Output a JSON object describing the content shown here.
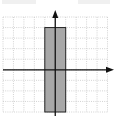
{
  "diagram": {
    "type": "coordinate-plane",
    "grid": {
      "x_min": -5,
      "x_max": 5,
      "y_min": -4,
      "y_max": 5,
      "step": 1,
      "line_style": "dotted",
      "line_color": "#c8c8c8"
    },
    "axes": {
      "color": "#111111",
      "x_axis_arrow": "right",
      "y_axis_arrow": "up"
    },
    "shape": {
      "kind": "rectangle",
      "x1": -1,
      "x2": 1,
      "y1": -4,
      "y2": 4,
      "fill": "#a8a8a8",
      "stroke": "#222222"
    },
    "top_text": "cropped, illegible"
  }
}
